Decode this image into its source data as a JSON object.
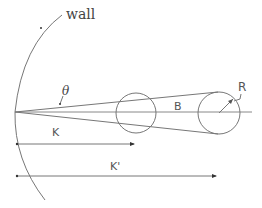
{
  "diagram": {
    "colors": {
      "stroke": "#777777",
      "text": "#444444",
      "background": "#ffffff"
    },
    "labels": {
      "wall": "wall",
      "theta": "θ",
      "B": "B",
      "R": "R",
      "K": "K",
      "K_prime": "K'"
    },
    "elements": {
      "wall": {
        "type": "arc",
        "description": "curved wall boundary"
      },
      "apex": {
        "x": 15,
        "y": 112
      },
      "center_line": {
        "x1": 15,
        "y1": 112,
        "x2": 252,
        "y2": 112
      },
      "circle_near": {
        "cx": 136,
        "cy": 113,
        "r": 20
      },
      "circle_far": {
        "cx": 219,
        "cy": 113,
        "r": 21
      },
      "tangent_upper": {
        "x1": 15,
        "y1": 112,
        "x2": 218,
        "y2": 92
      },
      "tangent_lower": {
        "x1": 15,
        "y1": 112,
        "x2": 218,
        "y2": 134
      },
      "dimension_K": {
        "x1": 17,
        "x2": 134,
        "y": 144
      },
      "dimension_K_prime": {
        "x1": 17,
        "x2": 216,
        "y": 176
      }
    }
  }
}
